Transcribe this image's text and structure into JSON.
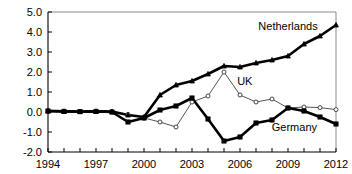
{
  "chart_data": {
    "type": "line",
    "title": "",
    "subtitle": "",
    "xlabel": "",
    "ylabel": "",
    "x": [
      1994,
      1995,
      1996,
      1997,
      1998,
      1999,
      2000,
      2001,
      2002,
      2003,
      2004,
      2005,
      2006,
      2007,
      2008,
      2009,
      2010,
      2011,
      2012
    ],
    "xlim": [
      1994,
      2012
    ],
    "ylim": [
      -2.0,
      5.0
    ],
    "xticks": [
      1994,
      1995,
      1996,
      1997,
      1998,
      1999,
      2000,
      2001,
      2002,
      2003,
      2004,
      2005,
      2006,
      2007,
      2008,
      2009,
      2010,
      2011,
      2012
    ],
    "xtick_labels": [
      "1994",
      "",
      "",
      "1997",
      "",
      "",
      "2000",
      "",
      "",
      "2003",
      "",
      "",
      "2006",
      "",
      "",
      "2009",
      "",
      "",
      "2012"
    ],
    "yticks": [
      -2.0,
      -1.0,
      0.0,
      1.0,
      2.0,
      3.0,
      4.0,
      5.0
    ],
    "ytick_labels": [
      "-2.0",
      "-1.0",
      "0.0",
      "1.0",
      "2.0",
      "3.0",
      "4.0",
      "5.0"
    ],
    "grid": false,
    "legend_position": "inline-annotations",
    "series": [
      {
        "name": "Netherlands",
        "marker": "filled-triangle",
        "line_weight": "thick",
        "color": "#000000",
        "values": [
          0.05,
          0.03,
          0.02,
          0.03,
          0.02,
          -0.15,
          -0.25,
          0.85,
          1.35,
          1.55,
          1.9,
          2.3,
          2.25,
          2.45,
          2.6,
          2.8,
          3.4,
          3.8,
          4.35
        ]
      },
      {
        "name": "UK",
        "marker": "open-circle",
        "line_weight": "thin",
        "color": "#555555",
        "values": [
          0.05,
          0.03,
          0.02,
          0.03,
          0.0,
          -0.12,
          -0.3,
          -0.5,
          -0.75,
          0.5,
          0.8,
          2.0,
          0.85,
          0.5,
          0.65,
          0.2,
          0.25,
          0.22,
          0.12
        ]
      },
      {
        "name": "Germany",
        "marker": "filled-square",
        "line_weight": "thick",
        "color": "#000000",
        "values": [
          0.05,
          0.03,
          0.02,
          0.03,
          0.0,
          -0.5,
          -0.3,
          0.1,
          0.3,
          0.7,
          -0.35,
          -1.45,
          -1.25,
          -0.55,
          -0.4,
          0.2,
          0.05,
          -0.25,
          -0.6
        ]
      }
    ],
    "annotations": [
      {
        "text": "Netherlands",
        "x": 2009.0,
        "y": 4.1
      },
      {
        "text": "UK",
        "x": 2006.3,
        "y": 1.35
      },
      {
        "text": "Germany",
        "x": 2009.4,
        "y": -0.95
      }
    ]
  }
}
